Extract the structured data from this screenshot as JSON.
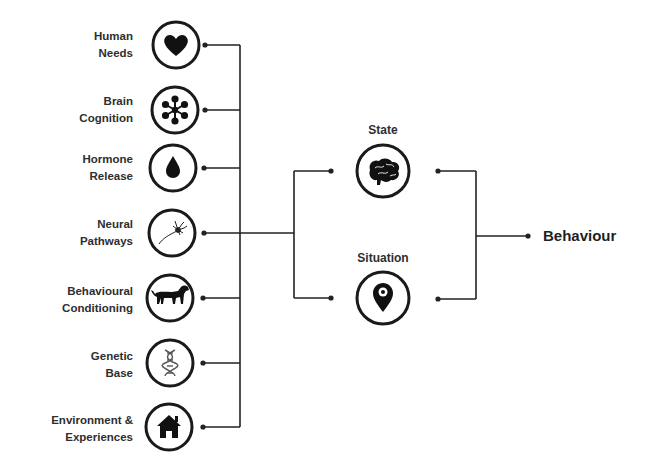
{
  "diagram": {
    "inputs": [
      {
        "line1": "Human",
        "line2": "Needs",
        "icon": "heart-icon",
        "cy": 45
      },
      {
        "line1": "Brain",
        "line2": "Cognition",
        "icon": "network-icon",
        "cy": 110
      },
      {
        "line1": "Hormone",
        "line2": "Release",
        "icon": "drop-icon",
        "cy": 168
      },
      {
        "line1": "Neural",
        "line2": "Pathways",
        "icon": "neuron-icon",
        "cy": 233
      },
      {
        "line1": "Behavioural",
        "line2": "Conditioning",
        "icon": "dog-icon",
        "cy": 298
      },
      {
        "line1": "Genetic",
        "line2": "Base",
        "icon": "dna-icon",
        "cy": 363
      },
      {
        "line1": "Environment &",
        "line2": "Experiences",
        "icon": "house-icon",
        "cy": 427
      }
    ],
    "middle": [
      {
        "label": "State",
        "icon": "brain-icon",
        "cy": 171
      },
      {
        "label": "Situation",
        "icon": "location-pin-icon",
        "cy": 298
      }
    ],
    "output": {
      "label": "Behaviour"
    },
    "colors": {
      "stroke": "#222222",
      "text": "#2e2e2e",
      "background": "#ffffff"
    }
  }
}
